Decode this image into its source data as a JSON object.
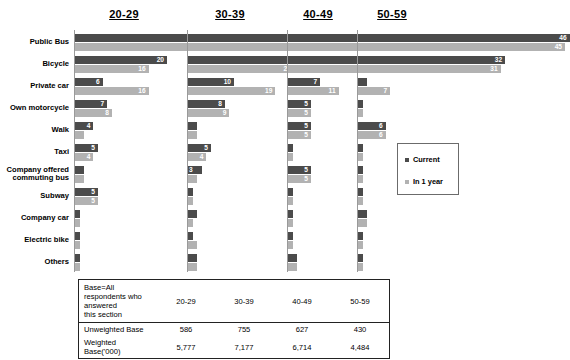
{
  "legend": {
    "entries": [
      {
        "label": "Current",
        "color": "#4b4b4b",
        "key": "current"
      },
      {
        "label": "In 1 year",
        "color": "#b2b2b2",
        "key": "future"
      }
    ]
  },
  "base_table": {
    "title": "Base=All respondents who answered this section",
    "column_headers": [
      "20-29",
      "30-39",
      "40-49",
      "50-59"
    ],
    "rows": [
      {
        "label": "Unweighted Base",
        "values": [
          "586",
          "755",
          "627",
          "430"
        ]
      },
      {
        "label": "Weighted Base('000)",
        "values": [
          "5,777",
          "7,177",
          "6,714",
          "4,484"
        ]
      }
    ]
  },
  "chart_data": {
    "type": "bar",
    "orientation": "horizontal",
    "title": "",
    "xlabel": "",
    "ylabel": "",
    "xlim": [
      0,
      55
    ],
    "grid": false,
    "legend_position": "right",
    "panels": [
      "20-29",
      "30-39",
      "40-49",
      "50-59"
    ],
    "categories": [
      "Public Bus",
      "Bicycle",
      "Private car",
      "Own motorcycle",
      "Walk",
      "Taxi",
      "Company offered commuting bus",
      "Subway",
      "Company car",
      "Electric bike",
      "Others"
    ],
    "series": [
      {
        "name": "Current",
        "color": "#4b4b4b",
        "panel_values": {
          "20-29": [
            51,
            20,
            6,
            7,
            4,
            5,
            2,
            5,
            1,
            1,
            1
          ],
          "30-39": [
            39,
            29,
            10,
            8,
            2,
            5,
            3,
            1,
            2,
            1,
            2
          ],
          "40-49": [
            37,
            33,
            7,
            5,
            5,
            1,
            5,
            1,
            1,
            1,
            2
          ],
          "50-59": [
            46,
            32,
            2,
            1,
            6,
            1,
            1,
            1,
            2,
            1,
            1
          ]
        }
      },
      {
        "name": "In 1 year",
        "color": "#b2b2b2",
        "panel_values": {
          "20-29": [
            46,
            16,
            16,
            8,
            2,
            4,
            2,
            5,
            1,
            1,
            1
          ],
          "30-39": [
            35,
            23,
            19,
            9,
            2,
            4,
            2,
            1,
            1,
            2,
            2
          ],
          "40-49": [
            34,
            31,
            11,
            5,
            5,
            1,
            5,
            1,
            1,
            1,
            2
          ],
          "50-59": [
            45,
            31,
            7,
            1,
            6,
            1,
            1,
            1,
            2,
            1,
            1
          ]
        }
      }
    ],
    "labeled_values": {
      "20-29": {
        "current": [
          "51",
          "20",
          "6",
          "7",
          "4",
          "5",
          "",
          "5",
          "",
          "",
          ""
        ],
        "future": [
          "46",
          "16",
          "16",
          "8",
          "",
          "4",
          "",
          "5",
          "",
          "",
          ""
        ]
      },
      "30-39": {
        "current": [
          "39",
          "29",
          "10",
          "8",
          "",
          "5",
          "3",
          "",
          "",
          "",
          ""
        ],
        "future": [
          "35",
          "23",
          "19",
          "9",
          "",
          "4",
          "",
          "",
          "",
          "",
          ""
        ]
      },
      "40-49": {
        "current": [
          "37",
          "33",
          "7",
          "5",
          "5",
          "",
          "5",
          "",
          "",
          "",
          ""
        ],
        "future": [
          "34",
          "31",
          "11",
          "5",
          "5",
          "",
          "5",
          "",
          "",
          "",
          ""
        ]
      },
      "50-59": {
        "current": [
          "46",
          "32",
          "",
          "",
          "6",
          "",
          "",
          "",
          "",
          "",
          ""
        ],
        "future": [
          "45",
          "31",
          "7",
          "",
          "6",
          "",
          "",
          "",
          "",
          "",
          ""
        ]
      }
    }
  }
}
